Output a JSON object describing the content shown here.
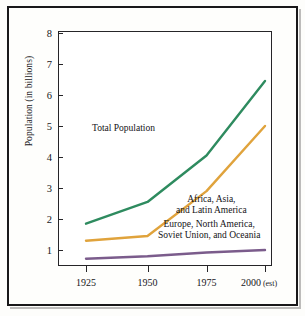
{
  "chart_data": {
    "type": "line",
    "title": "",
    "xlabel": "",
    "ylabel": "Population (in billions)",
    "x": [
      1925,
      1950,
      1975,
      2000
    ],
    "x_tick_labels": [
      "1925",
      "1950",
      "1975",
      "2000"
    ],
    "x_last_suffix": " (est)",
    "xlim": [
      1915,
      2008
    ],
    "ylim": [
      0,
      8
    ],
    "y_ticks": [
      1,
      2,
      3,
      4,
      5,
      6,
      7,
      8
    ],
    "y_tick_labels": [
      "1",
      "2",
      "3",
      "4",
      "5",
      "6",
      "7",
      "8"
    ],
    "grid": false,
    "legend_position": "inline-annotations",
    "series": [
      {
        "name": "Total Population",
        "color": "#2E8B5F",
        "values": [
          1.85,
          2.55,
          4.05,
          6.45
        ]
      },
      {
        "name": "Africa, Asia, and Latin America",
        "color": "#E0A33C",
        "values": [
          1.3,
          1.45,
          2.9,
          5.0
        ]
      },
      {
        "name": "Europe, North America, Soviet Union, and Oceania",
        "color": "#7B5C8C",
        "values": [
          0.72,
          0.8,
          0.92,
          1.0
        ]
      }
    ],
    "annotations": [
      {
        "id": "total",
        "text": "Total Population"
      },
      {
        "id": "south_line1",
        "text": "Africa, Asia,"
      },
      {
        "id": "south_line2",
        "text": "and Latin America"
      },
      {
        "id": "north_line1",
        "text": "Europe, North America,"
      },
      {
        "id": "north_line2",
        "text": "Soviet Union, and Oceania"
      }
    ]
  },
  "axis": {
    "y_label": "Population (in billions)",
    "y_ticks": [
      "8",
      "7",
      "6",
      "5",
      "4",
      "3",
      "2",
      "1"
    ],
    "x_ticks": [
      "1925",
      "1950",
      "1975",
      "2000"
    ],
    "x_est_suffix": "(est)"
  },
  "annotations": {
    "total_population": "Total Population",
    "south_line1": "Africa, Asia,",
    "south_line2": "and Latin America",
    "north_line1": "Europe, North America,",
    "north_line2": "Soviet Union, and Oceania"
  },
  "colors": {
    "total": "#2E8B5F",
    "developing": "#E0A33C",
    "developed": "#7B5C8C",
    "axis": "#262528",
    "text": "#17161a",
    "page_border": "#19181a"
  }
}
